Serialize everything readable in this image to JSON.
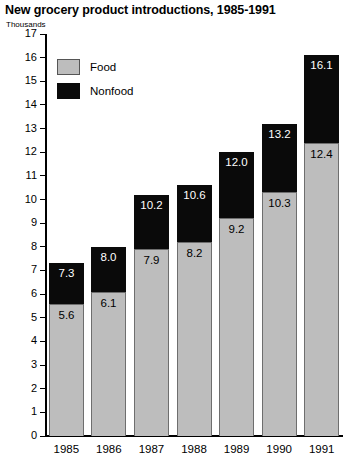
{
  "chart_data": {
    "type": "bar",
    "title": "New grocery product introductions, 1985-1991",
    "subtitle": "Thousands",
    "xlabel": "",
    "ylabel": "Thousands",
    "ylim": [
      0,
      17
    ],
    "yticks": [
      0,
      1,
      2,
      3,
      4,
      5,
      6,
      7,
      8,
      9,
      10,
      11,
      12,
      13,
      14,
      15,
      16,
      17
    ],
    "grid": false,
    "stacked": true,
    "legend_position": "top-left",
    "categories": [
      "1985",
      "1986",
      "1987",
      "1988",
      "1989",
      "1990",
      "1991"
    ],
    "series": [
      {
        "name": "Food",
        "color": "#bdbdbd",
        "values": [
          5.6,
          6.1,
          7.9,
          8.2,
          9.2,
          10.3,
          12.4
        ],
        "labels": [
          "5.6",
          "6.1",
          "7.9",
          "8.2",
          "9.2",
          "10.3",
          "12.4"
        ]
      },
      {
        "name": "Nonfood",
        "color": "#0a0a0a",
        "values": [
          1.7,
          1.9,
          2.3,
          2.4,
          2.8,
          2.9,
          3.7
        ],
        "cumulative_totals": [
          7.3,
          8.0,
          10.2,
          10.6,
          12.0,
          13.2,
          16.1
        ],
        "labels": [
          "7.3",
          "8.0",
          "10.2",
          "10.6",
          "12.0",
          "13.2",
          "16.1"
        ]
      }
    ],
    "totals": [
      7.3,
      8.0,
      10.2,
      10.6,
      12.0,
      13.2,
      16.1
    ]
  },
  "legend": {
    "items": [
      {
        "label": "Food",
        "color": "#bdbdbd"
      },
      {
        "label": "Nonfood",
        "color": "#0a0a0a"
      }
    ]
  },
  "axis": {
    "y_labels": [
      "17",
      "16",
      "15",
      "14",
      "13",
      "12",
      "11",
      "10",
      "9",
      "8",
      "7",
      "6",
      "5",
      "4",
      "3",
      "2",
      "1",
      "0"
    ],
    "x_labels": [
      "1985",
      "1986",
      "1987",
      "1988",
      "1989",
      "1990",
      "1991"
    ]
  }
}
